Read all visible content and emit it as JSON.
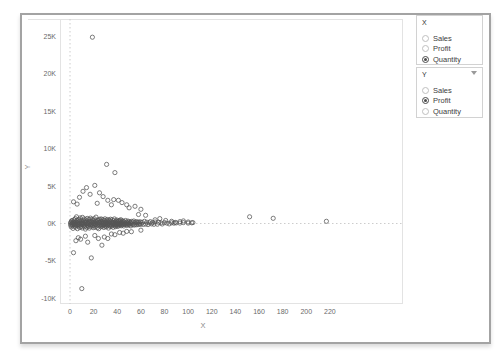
{
  "colors": {
    "marker": "#555555",
    "zero_line": "#cccccc",
    "pane_border": "#e3e3e3",
    "tick_text": "#6a6a6a",
    "axis_title_text": "#8a8a8a",
    "frame_border": "#a3a3a3"
  },
  "controls": {
    "x_param": {
      "title": "X",
      "options": [
        {
          "label": "Sales",
          "selected": false
        },
        {
          "label": "Profit",
          "selected": false
        },
        {
          "label": "Quantity",
          "selected": true
        }
      ]
    },
    "y_param": {
      "title": "Y",
      "options": [
        {
          "label": "Sales",
          "selected": false
        },
        {
          "label": "Profit",
          "selected": true
        },
        {
          "label": "Quantity",
          "selected": false
        }
      ]
    }
  },
  "chart_data": {
    "type": "scatter",
    "title": "",
    "xlabel": "X",
    "ylabel": "Y",
    "xlim": [
      -8,
      282
    ],
    "ylim": [
      -10800,
      27400
    ],
    "grid": "zero-lines-dotted",
    "legend": "none",
    "marker": {
      "shape": "open-circle",
      "color": "#555555"
    },
    "x_ticks": [
      {
        "v": 0,
        "label": "0"
      },
      {
        "v": 20,
        "label": "20"
      },
      {
        "v": 40,
        "label": "40"
      },
      {
        "v": 60,
        "label": "60"
      },
      {
        "v": 80,
        "label": "80"
      },
      {
        "v": 100,
        "label": "100"
      },
      {
        "v": 120,
        "label": "120"
      },
      {
        "v": 140,
        "label": "140"
      },
      {
        "v": 160,
        "label": "160"
      },
      {
        "v": 180,
        "label": "180"
      },
      {
        "v": 200,
        "label": "200"
      },
      {
        "v": 220,
        "label": "220"
      }
    ],
    "y_ticks": [
      {
        "v": 25000,
        "label": "25K"
      },
      {
        "v": 20000,
        "label": "20K"
      },
      {
        "v": 15000,
        "label": "15K"
      },
      {
        "v": 10000,
        "label": "10K"
      },
      {
        "v": 5000,
        "label": "5K"
      },
      {
        "v": 0,
        "label": "0K"
      },
      {
        "v": -5000,
        "label": "-5K"
      },
      {
        "v": -10000,
        "label": "-10K"
      }
    ],
    "points": [
      [
        19,
        24900
      ],
      [
        31,
        7900
      ],
      [
        38,
        6800
      ],
      [
        21,
        5100
      ],
      [
        14,
        4800
      ],
      [
        11,
        4300
      ],
      [
        25,
        4100
      ],
      [
        17,
        3900
      ],
      [
        28,
        3600
      ],
      [
        8,
        3500
      ],
      [
        37,
        3200
      ],
      [
        32,
        3100
      ],
      [
        41,
        3100
      ],
      [
        3,
        2900
      ],
      [
        44,
        2800
      ],
      [
        23,
        2700
      ],
      [
        6,
        2600
      ],
      [
        48,
        2500
      ],
      [
        35,
        2500
      ],
      [
        55,
        2300
      ],
      [
        50,
        2100
      ],
      [
        60,
        1900
      ],
      [
        10,
        -8700
      ],
      [
        18,
        -4600
      ],
      [
        3,
        -3900
      ],
      [
        27,
        -2900
      ],
      [
        15,
        -2500
      ],
      [
        5,
        -2300
      ],
      [
        9,
        -2100
      ],
      [
        24,
        -2000
      ],
      [
        32,
        -2000
      ],
      [
        7,
        -1900
      ],
      [
        29,
        -1800
      ],
      [
        13,
        -1700
      ],
      [
        21,
        -1600
      ],
      [
        38,
        -1500
      ],
      [
        35,
        -1400
      ],
      [
        45,
        -1300
      ],
      [
        42,
        -1200
      ],
      [
        52,
        -1100
      ],
      [
        48,
        -1050
      ],
      [
        60,
        -900
      ],
      [
        58,
        1200
      ],
      [
        64,
        1100
      ],
      [
        72,
        500
      ],
      [
        76,
        650
      ],
      [
        81,
        400
      ],
      [
        86,
        300
      ],
      [
        89,
        150
      ],
      [
        93,
        250
      ],
      [
        96,
        350
      ],
      [
        100,
        200
      ],
      [
        104,
        120
      ],
      [
        152,
        900
      ],
      [
        172,
        700
      ],
      [
        217,
        300
      ],
      [
        0.5,
        -200
      ],
      [
        0.8,
        150
      ],
      [
        1,
        -450
      ],
      [
        1.2,
        300
      ],
      [
        0.6,
        50
      ],
      [
        1.5,
        -120
      ],
      [
        1.8,
        420
      ],
      [
        2,
        -300
      ],
      [
        2.2,
        80
      ],
      [
        2.5,
        -650
      ],
      [
        3,
        200
      ],
      [
        3.2,
        -150
      ],
      [
        3.5,
        500
      ],
      [
        3.8,
        -380
      ],
      [
        4,
        120
      ],
      [
        4.2,
        -80
      ],
      [
        4.5,
        650
      ],
      [
        4.8,
        -500
      ],
      [
        5,
        250
      ],
      [
        5.2,
        -180
      ],
      [
        5.5,
        900
      ],
      [
        5.8,
        -250
      ],
      [
        6,
        400
      ],
      [
        6.3,
        -700
      ],
      [
        6.6,
        150
      ],
      [
        7,
        -350
      ],
      [
        7.3,
        550
      ],
      [
        7.6,
        -120
      ],
      [
        8,
        300
      ],
      [
        8.3,
        -550
      ],
      [
        8.6,
        750
      ],
      [
        9,
        -200
      ],
      [
        9.3,
        450
      ],
      [
        9.6,
        -400
      ],
      [
        10,
        100
      ],
      [
        10.3,
        -600
      ],
      [
        10.6,
        820
      ],
      [
        11,
        -150
      ],
      [
        11.3,
        350
      ],
      [
        11.6,
        -300
      ],
      [
        12,
        600
      ],
      [
        12.3,
        -450
      ],
      [
        12.6,
        200
      ],
      [
        13,
        -750
      ],
      [
        13.3,
        480
      ],
      [
        13.6,
        -100
      ],
      [
        14,
        320
      ],
      [
        14.3,
        -520
      ],
      [
        14.6,
        680
      ],
      [
        15,
        -250
      ],
      [
        15.3,
        150
      ],
      [
        15.6,
        -380
      ],
      [
        16,
        550
      ],
      [
        16.3,
        -620
      ],
      [
        16.6,
        280
      ],
      [
        17,
        -180
      ],
      [
        17.3,
        720
      ],
      [
        17.6,
        -420
      ],
      [
        18,
        250
      ],
      [
        18.3,
        -90
      ],
      [
        18.6,
        580
      ],
      [
        19,
        -310
      ],
      [
        19.3,
        430
      ],
      [
        19.6,
        -560
      ],
      [
        20,
        180
      ],
      [
        20.3,
        -230
      ],
      [
        20.6,
        640
      ],
      [
        21,
        -480
      ],
      [
        21.3,
        310
      ],
      [
        21.6,
        -130
      ],
      [
        22,
        860
      ],
      [
        22.3,
        -350
      ],
      [
        22.6,
        220
      ],
      [
        23,
        -580
      ],
      [
        23.3,
        470
      ],
      [
        23.6,
        -200
      ],
      [
        24,
        390
      ],
      [
        24.3,
        -700
      ],
      [
        24.6,
        140
      ],
      [
        25,
        560
      ],
      [
        25.3,
        -260
      ],
      [
        25.6,
        330
      ],
      [
        26,
        -440
      ],
      [
        26.3,
        610
      ],
      [
        26.6,
        -160
      ],
      [
        27,
        280
      ],
      [
        27.3,
        -380
      ],
      [
        27.6,
        520
      ],
      [
        28,
        -240
      ],
      [
        28.3,
        160
      ],
      [
        28.6,
        -540
      ],
      [
        29,
        410
      ],
      [
        29.3,
        -190
      ],
      [
        29.6,
        630
      ],
      [
        30,
        -330
      ],
      [
        30.3,
        240
      ],
      [
        30.6,
        -460
      ],
      [
        31,
        360
      ],
      [
        31.3,
        -140
      ],
      [
        31.6,
        540
      ],
      [
        32,
        -280
      ],
      [
        32.3,
        190
      ],
      [
        32.6,
        -610
      ],
      [
        33,
        450
      ],
      [
        33.3,
        -230
      ],
      [
        33.6,
        320
      ],
      [
        34,
        -400
      ],
      [
        34.3,
        580
      ],
      [
        34.6,
        -170
      ],
      [
        35,
        260
      ],
      [
        35.3,
        -350
      ],
      [
        35.6,
        490
      ],
      [
        36,
        -220
      ],
      [
        36.3,
        140
      ],
      [
        36.6,
        -520
      ],
      [
        37,
        380
      ],
      [
        37.3,
        -160
      ],
      [
        37.6,
        610
      ],
      [
        38,
        -290
      ],
      [
        38.3,
        210
      ],
      [
        38.6,
        -430
      ],
      [
        39,
        330
      ],
      [
        39.3,
        -120
      ],
      [
        39.6,
        470
      ],
      [
        40,
        -260
      ],
      [
        40.3,
        180
      ],
      [
        40.6,
        -390
      ],
      [
        41,
        290
      ],
      [
        41.3,
        -150
      ],
      [
        41.6,
        420
      ],
      [
        42,
        -240
      ],
      [
        42.3,
        350
      ],
      [
        42.6,
        -100
      ],
      [
        43,
        510
      ],
      [
        43.3,
        -310
      ],
      [
        43.6,
        160
      ],
      [
        44,
        -200
      ],
      [
        44.3,
        380
      ],
      [
        44.6,
        -140
      ],
      [
        45,
        280
      ],
      [
        45.5,
        -330
      ],
      [
        46,
        220
      ],
      [
        46.5,
        -90
      ],
      [
        47,
        400
      ],
      [
        47.5,
        -180
      ],
      [
        48,
        150
      ],
      [
        48.5,
        -260
      ],
      [
        49,
        340
      ],
      [
        49.5,
        -120
      ],
      [
        50,
        240
      ],
      [
        50.5,
        -200
      ],
      [
        51,
        160
      ],
      [
        51.5,
        -320
      ],
      [
        52,
        280
      ],
      [
        52.5,
        -80
      ],
      [
        53,
        200
      ],
      [
        53.5,
        -150
      ],
      [
        54,
        330
      ],
      [
        54.5,
        -220
      ],
      [
        55,
        120
      ],
      [
        55.5,
        -100
      ],
      [
        56,
        260
      ],
      [
        56.5,
        -180
      ],
      [
        57,
        90
      ],
      [
        57.5,
        200
      ],
      [
        58,
        -140
      ],
      [
        58.5,
        170
      ],
      [
        59,
        -60
      ],
      [
        59.5,
        230
      ],
      [
        60,
        -110
      ],
      [
        2,
        30
      ],
      [
        3,
        -60
      ],
      [
        4,
        90
      ],
      [
        5,
        -40
      ],
      [
        6,
        60
      ],
      [
        7,
        -80
      ],
      [
        8,
        40
      ],
      [
        9,
        110
      ],
      [
        10,
        -70
      ],
      [
        11,
        80
      ],
      [
        12,
        -50
      ],
      [
        13,
        130
      ],
      [
        14,
        -90
      ],
      [
        15,
        60
      ],
      [
        16,
        -120
      ],
      [
        17,
        100
      ],
      [
        18,
        -40
      ],
      [
        19,
        140
      ],
      [
        20,
        -80
      ],
      [
        21,
        60
      ],
      [
        22,
        -110
      ],
      [
        23,
        90
      ],
      [
        24,
        -60
      ],
      [
        25,
        120
      ],
      [
        26,
        -90
      ],
      [
        27,
        70
      ],
      [
        28,
        -130
      ],
      [
        29,
        100
      ],
      [
        30,
        -50
      ],
      [
        31,
        80
      ],
      [
        32,
        -100
      ],
      [
        33,
        60
      ],
      [
        34,
        -70
      ],
      [
        35,
        110
      ],
      [
        36,
        -40
      ],
      [
        37,
        90
      ],
      [
        38,
        -120
      ],
      [
        39,
        50
      ],
      [
        40,
        -90
      ],
      [
        41,
        70
      ],
      [
        42,
        -60
      ],
      [
        43,
        100
      ],
      [
        44,
        -40
      ],
      [
        45,
        80
      ],
      [
        46,
        -110
      ],
      [
        47,
        50
      ],
      [
        48,
        -70
      ],
      [
        49,
        90
      ],
      [
        50,
        -50
      ],
      [
        51,
        60
      ],
      [
        10,
        20
      ],
      [
        20,
        10
      ],
      [
        30,
        25
      ],
      [
        40,
        -15
      ],
      [
        15,
        5
      ],
      [
        61,
        150
      ],
      [
        62,
        -120
      ],
      [
        63,
        300
      ],
      [
        64,
        -80
      ],
      [
        65,
        180
      ],
      [
        66,
        -150
      ],
      [
        67,
        100
      ],
      [
        68,
        250
      ],
      [
        69,
        -60
      ],
      [
        70,
        140
      ],
      [
        71,
        -110
      ],
      [
        72,
        200
      ],
      [
        74,
        -90
      ],
      [
        75,
        160
      ],
      [
        77,
        80
      ],
      [
        78,
        -70
      ],
      [
        80,
        120
      ],
      [
        82,
        60
      ],
      [
        84,
        -50
      ],
      [
        86,
        100
      ],
      [
        88,
        40
      ],
      [
        90,
        80
      ],
      [
        93,
        50
      ],
      [
        96,
        120
      ],
      [
        100,
        60
      ],
      [
        103,
        90
      ]
    ]
  }
}
